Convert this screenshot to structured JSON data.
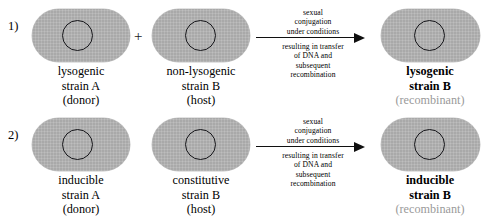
{
  "diagram": {
    "title": "Conjugation crosses transferring lysogeny and inducibility",
    "colors": {
      "cell_fill": "#a9a9a9",
      "nucleoid_stroke": "#16161a",
      "arrow": "#101010",
      "muted_text": "#9a9a9a",
      "background": "#ffffff"
    },
    "plus_sign": "+",
    "rows": [
      {
        "number_label": "1)",
        "donor": {
          "caption_lines": [
            "lysogenic",
            "strain A",
            "(donor)"
          ],
          "bold": false,
          "muted_line_index": null
        },
        "host": {
          "caption_lines": [
            "non-lysogenic",
            "strain B",
            "(host)"
          ],
          "bold": false,
          "muted_line_index": null
        },
        "arrow": {
          "above_lines": [
            "sexual",
            "conjugation",
            "under conditions"
          ],
          "below_lines": [
            "resulting in transfer",
            "of DNA and",
            "subsequent",
            "recombination"
          ]
        },
        "result": {
          "caption_lines": [
            "lysogenic",
            "strain B",
            "(recombinant)"
          ],
          "bold": true,
          "muted_line_index": 2
        }
      },
      {
        "number_label": "2)",
        "donor": {
          "caption_lines": [
            "inducible",
            "strain A",
            "(donor)"
          ],
          "bold": false,
          "muted_line_index": null
        },
        "host": {
          "caption_lines": [
            "constitutive",
            "strain B",
            "(host)"
          ],
          "bold": false,
          "muted_line_index": null
        },
        "arrow": {
          "above_lines": [
            "sexual",
            "conjugation",
            "under conditions"
          ],
          "below_lines": [
            "resulting in transfer",
            "of DNA and",
            "subsequent",
            "recombination"
          ]
        },
        "result": {
          "caption_lines": [
            "inducible",
            "strain B",
            "(recombinant)"
          ],
          "bold": true,
          "muted_line_index": 2
        }
      }
    ]
  }
}
